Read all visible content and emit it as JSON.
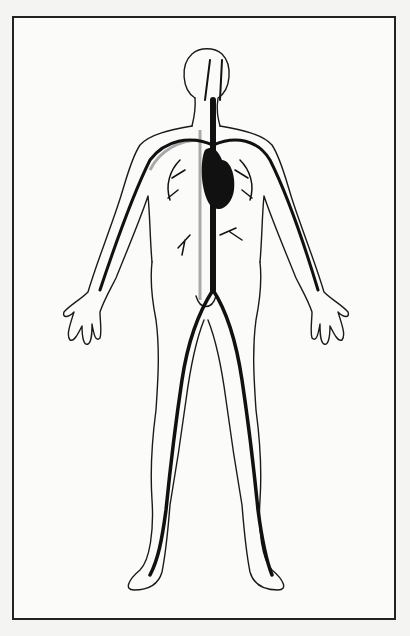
{
  "figure": {
    "style": "black-and-white line illustration",
    "frame_color": "#222222",
    "vessel_color": "#111111",
    "vein_color": "#aaaaaa",
    "background": "#fbfbfa"
  }
}
